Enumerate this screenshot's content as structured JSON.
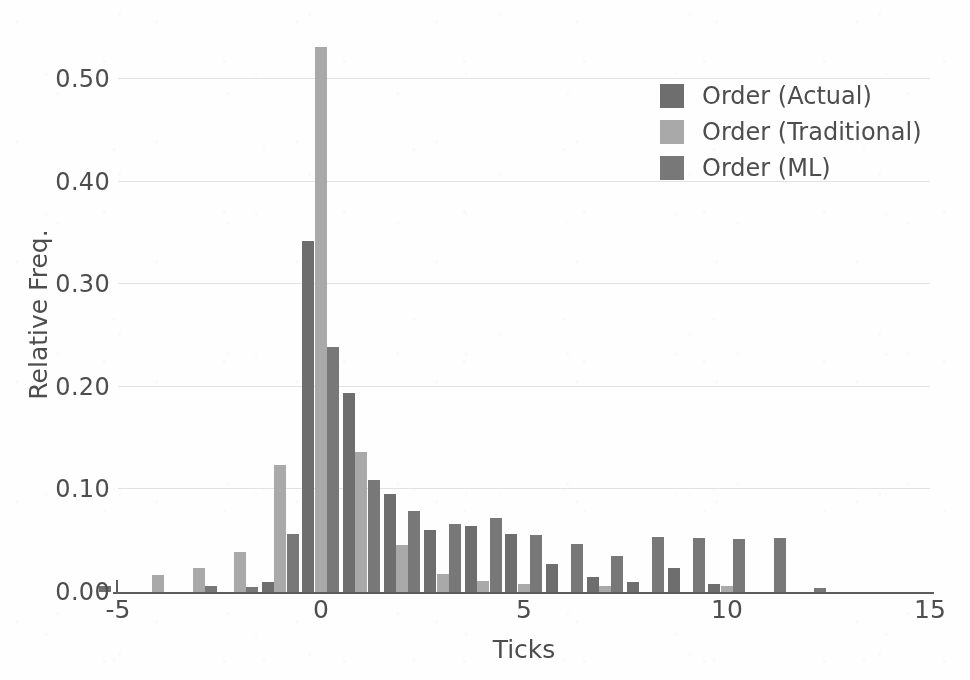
{
  "chart_data": {
    "type": "bar",
    "title": "",
    "xlabel": "Ticks",
    "ylabel": "Relative Freq.",
    "xlim": [
      -5,
      15
    ],
    "ylim": [
      0.0,
      0.55
    ],
    "xticks": [
      -5,
      0,
      5,
      10,
      15
    ],
    "xtick_labels": [
      "-5",
      "0",
      "5",
      "10",
      "15"
    ],
    "yticks": [
      0.0,
      0.1,
      0.2,
      0.3,
      0.4,
      0.5
    ],
    "ytick_labels": [
      "0.00",
      "0.10",
      "0.20",
      "0.30",
      "0.40",
      "0.50"
    ],
    "grid": true,
    "grid_axis": "y",
    "legend_position": "upper right",
    "bar_mode": "grouped",
    "bin_width": 1,
    "x": [
      -5,
      -4,
      -3,
      -2,
      -1,
      0,
      1,
      2,
      3,
      4,
      5,
      6,
      7,
      8,
      9,
      10,
      11,
      12
    ],
    "series": [
      {
        "name": "Order (Actual)",
        "color": "#6e6e6e",
        "values": [
          0.006,
          0.0,
          0.0,
          0.0,
          0.01,
          0.342,
          0.194,
          0.096,
          0.06,
          0.064,
          0.057,
          0.027,
          0.015,
          0.01,
          0.023,
          0.008,
          0.0,
          0.0
        ]
      },
      {
        "name": "Order (Traditional)",
        "color": "#a9a9a9",
        "values": [
          0.0,
          0.017,
          0.023,
          0.039,
          0.124,
          0.531,
          0.137,
          0.046,
          0.018,
          0.011,
          0.008,
          0.0,
          0.006,
          0.0,
          0.0,
          0.006,
          0.0,
          0.0
        ]
      },
      {
        "name": "Order (ML)",
        "color": "#787878",
        "values": [
          0.0,
          0.0,
          0.006,
          0.005,
          0.057,
          0.239,
          0.109,
          0.079,
          0.066,
          0.072,
          0.056,
          0.047,
          0.035,
          0.054,
          0.053,
          0.052,
          0.053,
          0.004
        ]
      }
    ]
  }
}
